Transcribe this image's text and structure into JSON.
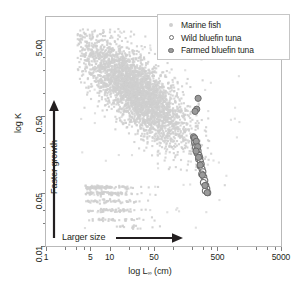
{
  "chart_data": {
    "type": "scatter",
    "title": "",
    "xlabel": "log L∞ (cm)",
    "ylabel": "log K",
    "xlabel_main": "log L",
    "xlabel_sub": "∞",
    "xlabel_unit": " (cm)",
    "xscale": "log",
    "yscale": "log",
    "xlim": [
      1,
      5000
    ],
    "ylim": [
      0.01,
      10
    ],
    "grid": false,
    "legend_position": "top-right",
    "xticks": [
      {
        "value": 1,
        "label": "1"
      },
      {
        "value": 5,
        "label": "5"
      },
      {
        "value": 10,
        "label": "10"
      },
      {
        "value": 50,
        "label": "50"
      },
      {
        "value": 500,
        "label": "500"
      },
      {
        "value": 5000,
        "label": "5000"
      }
    ],
    "yticks": [
      {
        "value": 5.0,
        "label": "5.00"
      },
      {
        "value": 0.5,
        "label": "0.50"
      },
      {
        "value": 0.05,
        "label": "0.05"
      },
      {
        "value": 0.01,
        "label": "0.01"
      }
    ],
    "annotations": [
      {
        "name": "faster-growth",
        "text": "Faster growth",
        "arrow": "up"
      },
      {
        "name": "larger-size",
        "text": "Larger size",
        "arrow": "right"
      }
    ],
    "series": [
      {
        "name": "Marine fish",
        "marker": "filled-small",
        "color": "#cfcfcf",
        "n_points": 3100,
        "description": "Dense cloud, negative log-log relationship between asymptotic length and growth coefficient"
      },
      {
        "name": "Wild bluefin tuna",
        "marker": "open-circle",
        "color": "#6f6f6f",
        "points": [
          [
            215,
            0.26
          ],
          [
            222,
            0.245
          ],
          [
            218,
            0.225
          ],
          [
            228,
            0.215
          ],
          [
            235,
            0.205
          ],
          [
            226,
            0.195
          ],
          [
            240,
            0.185
          ],
          [
            248,
            0.175
          ],
          [
            238,
            0.165
          ],
          [
            255,
            0.155
          ],
          [
            262,
            0.145
          ],
          [
            252,
            0.138
          ],
          [
            270,
            0.128
          ],
          [
            278,
            0.118
          ],
          [
            266,
            0.112
          ],
          [
            286,
            0.102
          ],
          [
            295,
            0.094
          ],
          [
            282,
            0.088
          ],
          [
            305,
            0.08
          ],
          [
            316,
            0.072
          ],
          [
            300,
            0.068
          ],
          [
            328,
            0.062
          ],
          [
            340,
            0.056
          ],
          [
            322,
            0.053
          ],
          [
            352,
            0.05
          ]
        ]
      },
      {
        "name": "Farmed bluefin tuna",
        "marker": "filled-circle",
        "color": "#8f8f8f",
        "points": [
          [
            248,
            0.86
          ],
          [
            236,
            0.62
          ],
          [
            222,
            0.58
          ],
          [
            210,
            0.27
          ],
          [
            218,
            0.26
          ],
          [
            232,
            0.235
          ],
          [
            244,
            0.2
          ],
          [
            230,
            0.175
          ],
          [
            252,
            0.145
          ],
          [
            268,
            0.115
          ],
          [
            290,
            0.085
          ],
          [
            318,
            0.062
          ],
          [
            345,
            0.05
          ]
        ]
      }
    ]
  },
  "legend": {
    "items": [
      {
        "label": "Marine fish",
        "marker": "filled-small"
      },
      {
        "label": "Wild bluefin tuna",
        "marker": "open-circle"
      },
      {
        "label": "Farmed bluefin tuna",
        "marker": "filled-circle"
      }
    ]
  }
}
